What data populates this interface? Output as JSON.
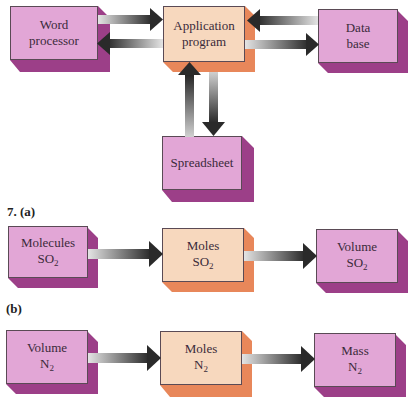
{
  "top_diagram": {
    "boxes": {
      "word_processor": {
        "line1": "Word",
        "line2": "processor"
      },
      "application_program": {
        "line1": "Application",
        "line2": "program"
      },
      "data_base": {
        "line1": "Data",
        "line2": "base"
      },
      "spreadsheet": {
        "line1": "Spreadsheet"
      }
    }
  },
  "part_a": {
    "label": "7. (a)",
    "boxes": [
      {
        "line1": "Molecules",
        "formula": "SO",
        "subscript": "2"
      },
      {
        "line1": "Moles",
        "formula": "SO",
        "subscript": "2"
      },
      {
        "line1": "Volume",
        "formula": "SO",
        "subscript": "2"
      }
    ]
  },
  "part_b": {
    "label": "(b)",
    "boxes": [
      {
        "line1": "Volume",
        "formula": "N",
        "subscript": "2"
      },
      {
        "line1": "Moles",
        "formula": "N",
        "subscript": "2"
      },
      {
        "line1": "Mass",
        "formula": "N",
        "subscript": "2"
      }
    ]
  },
  "colors": {
    "pink_front": "#e2a6d6",
    "pink_side": "#9c3f88",
    "peach_front": "#f7d8be",
    "peach_side": "#e8875a",
    "arrow_dark": "#2e2e2e",
    "arrow_light": "#d8d8d8"
  }
}
